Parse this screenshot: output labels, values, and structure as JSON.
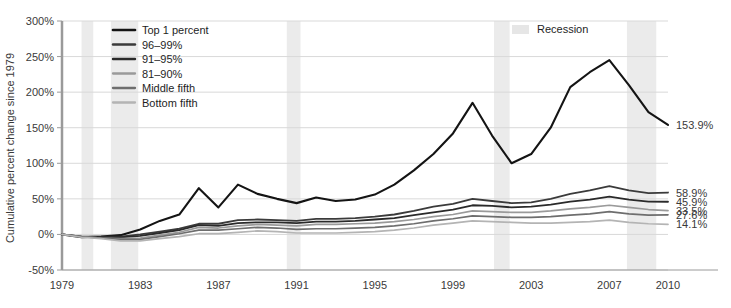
{
  "chart_data": {
    "type": "line",
    "title": "",
    "xlabel": "",
    "ylabel": "Cumulative percent change since 1979",
    "xlim": [
      1979,
      2010
    ],
    "ylim": [
      -50,
      300
    ],
    "grid": true,
    "legend_position": "top-left",
    "x_ticks": [
      "1979",
      "1983",
      "1987",
      "1991",
      "1995",
      "1999",
      "2003",
      "2007",
      "2010"
    ],
    "x_tick_values": [
      1979,
      1983,
      1987,
      1991,
      1995,
      1999,
      2003,
      2007,
      2010
    ],
    "y_ticks": [
      "-50%",
      "0%",
      "50%",
      "100%",
      "150%",
      "200%",
      "250%",
      "300%"
    ],
    "y_tick_values": [
      -50,
      0,
      50,
      100,
      150,
      200,
      250,
      300
    ],
    "x": [
      1979,
      1980,
      1981,
      1982,
      1983,
      1984,
      1985,
      1986,
      1987,
      1988,
      1989,
      1990,
      1991,
      1992,
      1993,
      1994,
      1995,
      1996,
      1997,
      1998,
      1999,
      2000,
      2001,
      2002,
      2003,
      2004,
      2005,
      2006,
      2007,
      2008,
      2009,
      2010
    ],
    "series": [
      {
        "name": "Top 1 percent",
        "color": "#141414",
        "width": 2.1,
        "end_label": "153.9%",
        "end_value": 153.9,
        "values": [
          0,
          -4,
          -3,
          -1,
          7,
          19,
          28,
          65,
          38,
          70,
          57,
          50,
          44,
          52,
          47,
          49,
          56,
          70,
          90,
          113,
          142,
          185,
          139,
          100,
          113,
          150,
          207,
          228,
          245,
          210,
          172,
          153.9
        ]
      },
      {
        "name": "96–99%",
        "color": "#3b3b3b",
        "width": 1.8,
        "end_label": "58.9%",
        "end_value": 58.9,
        "values": [
          0,
          -3,
          -3,
          -3,
          0,
          4,
          8,
          15,
          15,
          20,
          21,
          20,
          19,
          22,
          22,
          23,
          25,
          28,
          33,
          39,
          43,
          50,
          47,
          44,
          45,
          50,
          57,
          62,
          68,
          62,
          58,
          58.9
        ]
      },
      {
        "name": "91–95%",
        "color": "#2a2a2a",
        "width": 1.8,
        "end_label": "45.9%",
        "end_value": 45.9,
        "values": [
          0,
          -3,
          -4,
          -4,
          -2,
          2,
          6,
          13,
          12,
          16,
          17,
          17,
          16,
          18,
          18,
          19,
          21,
          23,
          27,
          31,
          35,
          41,
          40,
          38,
          39,
          42,
          46,
          49,
          53,
          49,
          46,
          45.9
        ]
      },
      {
        "name": "81–90%",
        "color": "#9a9a9a",
        "width": 1.7,
        "end_label": "33.5%",
        "end_value": 33.5,
        "values": [
          0,
          -3,
          -5,
          -6,
          -5,
          -1,
          3,
          10,
          9,
          12,
          14,
          13,
          12,
          14,
          14,
          15,
          16,
          18,
          21,
          25,
          28,
          33,
          32,
          31,
          31,
          33,
          36,
          38,
          41,
          38,
          35,
          33.5
        ]
      },
      {
        "name": "Middle fifth",
        "color": "#6e6e6e",
        "width": 1.7,
        "end_label": "27.6%",
        "end_value": 27.6,
        "values": [
          0,
          -3,
          -5,
          -7,
          -7,
          -3,
          1,
          6,
          6,
          8,
          10,
          9,
          7,
          8,
          8,
          9,
          10,
          12,
          15,
          19,
          22,
          26,
          25,
          24,
          24,
          25,
          27,
          29,
          32,
          29,
          27,
          27.6
        ]
      },
      {
        "name": "Bottom fifth",
        "color": "#b4b4b4",
        "width": 1.7,
        "end_label": "14.1%",
        "end_value": 14.1,
        "values": [
          0,
          -4,
          -6,
          -9,
          -9,
          -6,
          -3,
          1,
          1,
          3,
          5,
          4,
          2,
          2,
          2,
          3,
          4,
          6,
          9,
          13,
          16,
          19,
          18,
          17,
          16,
          16,
          17,
          18,
          20,
          17,
          15,
          14.1
        ]
      }
    ],
    "recessions": [
      {
        "start": 1980.0,
        "end": 1980.6
      },
      {
        "start": 1981.5,
        "end": 1982.9
      },
      {
        "start": 1990.5,
        "end": 1991.2
      },
      {
        "start": 2001.1,
        "end": 2001.9
      },
      {
        "start": 2007.9,
        "end": 2009.4
      }
    ],
    "legend": {
      "series_entries": [
        "Top 1 percent",
        "96–99%",
        "91–95%",
        "81–90%",
        "Middle fifth",
        "Bottom fifth"
      ],
      "recession_label": "Recession",
      "recession_color": "#e6e6e6"
    }
  }
}
